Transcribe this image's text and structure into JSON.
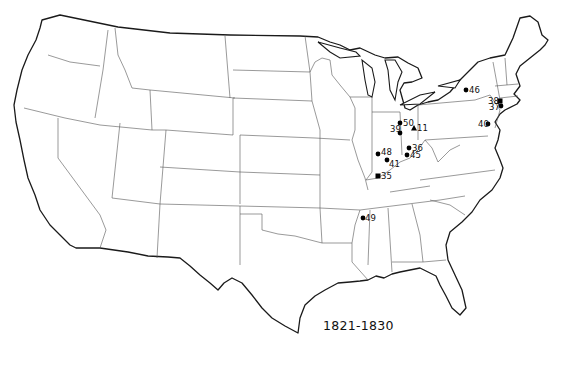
{
  "map": {
    "title": "1821-1830",
    "region": "Contiguous United States",
    "colors": {
      "outline": "#1a1a1a",
      "state_border": "#555555",
      "marker": "#000000",
      "background": "#ffffff"
    },
    "markers": [
      {
        "id": "50",
        "label": "50",
        "shape": "circle",
        "x": 400,
        "y": 123,
        "label_dx": 3,
        "label_dy": 3
      },
      {
        "id": "39",
        "label": "39",
        "shape": "circle",
        "x": 400,
        "y": 133,
        "label_dx": -10,
        "label_dy": -1
      },
      {
        "id": "11",
        "label": "11",
        "shape": "triangle",
        "x": 414,
        "y": 128,
        "label_dx": 3,
        "label_dy": 3
      },
      {
        "id": "36",
        "label": "36",
        "shape": "circle",
        "x": 409,
        "y": 148,
        "label_dx": 3,
        "label_dy": 3
      },
      {
        "id": "45",
        "label": "45",
        "shape": "circle",
        "x": 407,
        "y": 155,
        "label_dx": 3,
        "label_dy": 3
      },
      {
        "id": "48",
        "label": "48",
        "shape": "circle",
        "x": 378,
        "y": 154,
        "label_dx": 3,
        "label_dy": 1
      },
      {
        "id": "41",
        "label": "41",
        "shape": "circle",
        "x": 387,
        "y": 160,
        "label_dx": 2,
        "label_dy": 7
      },
      {
        "id": "35",
        "label": "35",
        "shape": "square",
        "x": 378,
        "y": 176,
        "label_dx": 3,
        "label_dy": 3
      },
      {
        "id": "46",
        "label": "46",
        "shape": "circle",
        "x": 466,
        "y": 90,
        "label_dx": 3,
        "label_dy": 3
      },
      {
        "id": "38",
        "label": "38",
        "shape": "square",
        "x": 500,
        "y": 101,
        "label_dx": -12,
        "label_dy": 3
      },
      {
        "id": "37",
        "label": "37",
        "shape": "circle",
        "x": 501,
        "y": 106,
        "label_dx": -12,
        "label_dy": 4
      },
      {
        "id": "40",
        "label": "40",
        "shape": "circle",
        "x": 488,
        "y": 124,
        "label_dx": -10,
        "label_dy": 3
      },
      {
        "id": "49",
        "label": "49",
        "shape": "circle",
        "x": 363,
        "y": 218,
        "label_dx": 2,
        "label_dy": 3
      }
    ]
  }
}
